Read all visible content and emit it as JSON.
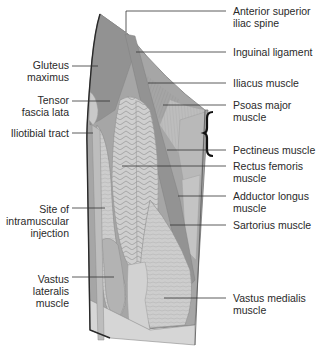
{
  "diagram": {
    "colors": {
      "background": "#ffffff",
      "muscle_dark": "#8f8f8f",
      "muscle_mid": "#a9a9a9",
      "muscle_light": "#c6c6c6",
      "muscle_pale": "#d9d9d9",
      "outline": "#2a2a2a",
      "text": "#2a2a2a"
    },
    "labels_left": [
      {
        "id": "gluteus-maximus",
        "lines": [
          "Gluteus",
          "maximus"
        ]
      },
      {
        "id": "tensor-fascia-lata",
        "lines": [
          "Tensor",
          "fascia lata"
        ]
      },
      {
        "id": "iliotibial-tract",
        "lines": [
          "Iliotibial tract"
        ]
      },
      {
        "id": "injection-site",
        "lines": [
          "Site of",
          "intramuscular",
          "injection"
        ]
      },
      {
        "id": "vastus-lateralis",
        "lines": [
          "Vastus",
          "lateralis",
          "muscle"
        ]
      }
    ],
    "labels_right": [
      {
        "id": "anterior-superior-iliac-spine",
        "lines": [
          "Anterior superior",
          "iliac spine"
        ]
      },
      {
        "id": "inguinal-ligament",
        "lines": [
          "Inguinal ligament"
        ]
      },
      {
        "id": "iliacus",
        "lines": [
          "Iliacus muscle"
        ]
      },
      {
        "id": "psoas-major",
        "lines": [
          "Psoas major",
          "muscle"
        ]
      },
      {
        "id": "pectineus",
        "lines": [
          "Pectineus muscle"
        ]
      },
      {
        "id": "rectus-femoris",
        "lines": [
          "Rectus femoris",
          "muscle"
        ]
      },
      {
        "id": "adductor-longus",
        "lines": [
          "Adductor longus",
          "muscle"
        ]
      },
      {
        "id": "sartorius",
        "lines": [
          "Sartorius muscle"
        ]
      },
      {
        "id": "vastus-medialis",
        "lines": [
          "Vastus medialis",
          "muscle"
        ]
      }
    ]
  }
}
